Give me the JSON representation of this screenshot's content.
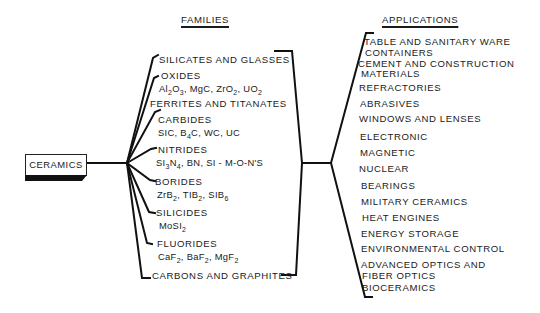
{
  "diagram": {
    "root": {
      "label": "CERAMICS"
    },
    "families_header": "FAMILIES",
    "applications_header": "APPLICATIONS",
    "families": [
      {
        "name": "SILICATES AND GLASSES",
        "formulas": ""
      },
      {
        "name": "OXIDES",
        "formulas": "Al2O3, MgC, ZrO2, UO2"
      },
      {
        "name": "FERRITES AND TITANATES",
        "formulas": ""
      },
      {
        "name": "CARBIDES",
        "formulas": "SIC, B4C, WC, UC"
      },
      {
        "name": "NITRIDES",
        "formulas": "SI3N4, BN, SI - M-O-N'S"
      },
      {
        "name": "BORIDES",
        "formulas": "ZrB2, TIB2, SIB6"
      },
      {
        "name": "SILICIDES",
        "formulas": "MoSI2"
      },
      {
        "name": "FLUORIDES",
        "formulas": "CaF2, BaF2, MgF2"
      },
      {
        "name": "CARBONS AND GRAPHITES",
        "formulas": ""
      }
    ],
    "applications": [
      "TABLE AND SANITARY WARE",
      "CONTAINERS",
      "CEMENT AND CONSTRUCTION",
      "MATERIALS",
      "REFRACTORIES",
      "ABRASIVES",
      "WINDOWS AND LENSES",
      "ELECTRONIC",
      "MAGNETIC",
      "NUCLEAR",
      "BEARINGS",
      "MILITARY CERAMICS",
      "HEAT ENGINES",
      "ENERGY STORAGE",
      "ENVIRONMENTAL CONTROL",
      "ADVANCED OPTICS AND",
      "FIBER OPTICS",
      "BIOCERAMICS"
    ],
    "line_color": "#111111"
  }
}
